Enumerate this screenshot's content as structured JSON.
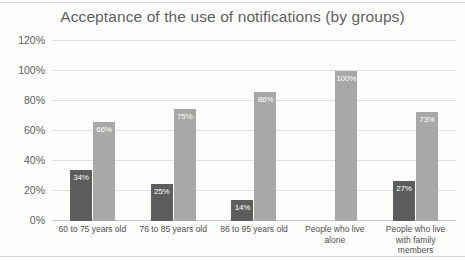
{
  "chart_data": {
    "type": "bar",
    "title": "Acceptance of the use of notifications (by groups)",
    "xlabel": "",
    "ylabel": "",
    "ylim": [
      0,
      120
    ],
    "ytick_labels": [
      "0%",
      "20%",
      "40%",
      "60%",
      "80%",
      "100%",
      "120%"
    ],
    "ytick_values": [
      0,
      20,
      40,
      60,
      80,
      100,
      120
    ],
    "grid": true,
    "legend": "none",
    "categories": [
      "60 to 75 years old",
      "76 to 85 years old",
      "86 to 95 years old",
      "People who live alone",
      "People who live with family members"
    ],
    "series": [
      {
        "name": "dark",
        "color": "#5d5d5d",
        "values": [
          34,
          25,
          14,
          null,
          27
        ],
        "labels": [
          "34%",
          "25%",
          "14%",
          "",
          "27%"
        ]
      },
      {
        "name": "light",
        "color": "#a8a8a6",
        "values": [
          66,
          75,
          86,
          100,
          73
        ],
        "labels": [
          "66%",
          "75%",
          "86%",
          "100%",
          "73%"
        ]
      }
    ]
  },
  "chart": {
    "title": "Acceptance of the use of notifications (by groups)",
    "y_ticks": [
      {
        "label": "120%",
        "value": 120
      },
      {
        "label": "100%",
        "value": 100
      },
      {
        "label": "80%",
        "value": 80
      },
      {
        "label": "60%",
        "value": 60
      },
      {
        "label": "40%",
        "value": 40
      },
      {
        "label": "20%",
        "value": 20
      },
      {
        "label": "0%",
        "value": 0
      }
    ],
    "groups": [
      {
        "category": "60 to 75 years old",
        "bars": [
          {
            "series": "dark",
            "value": 34,
            "label": "34%"
          },
          {
            "series": "light",
            "value": 66,
            "label": "66%"
          }
        ]
      },
      {
        "category": "76 to 85 years old",
        "bars": [
          {
            "series": "dark",
            "value": 25,
            "label": "25%"
          },
          {
            "series": "light",
            "value": 75,
            "label": "75%"
          }
        ]
      },
      {
        "category": "86 to 95 years old",
        "bars": [
          {
            "series": "dark",
            "value": 14,
            "label": "14%"
          },
          {
            "series": "light",
            "value": 86,
            "label": "86%"
          }
        ]
      },
      {
        "category": "People who live alone",
        "bars": [
          {
            "series": "dark",
            "value": 0,
            "label": ""
          },
          {
            "series": "light",
            "value": 100,
            "label": "100%"
          }
        ]
      },
      {
        "category": "People who live with family members",
        "bars": [
          {
            "series": "dark",
            "value": 27,
            "label": "27%"
          },
          {
            "series": "light",
            "value": 73,
            "label": "73%"
          }
        ]
      }
    ]
  },
  "colors": {
    "dark_bar": "#5d5d5d",
    "light_bar": "#a8a8a6",
    "gridline": "#e2e1dd",
    "axis": "#c9c8c3",
    "title_text": "#5f5f5f",
    "background": "#fdfdfc"
  }
}
